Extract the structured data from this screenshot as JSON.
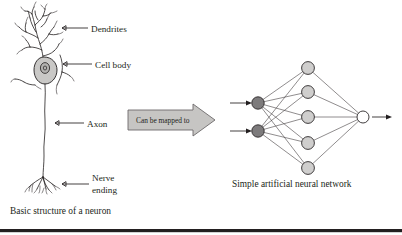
{
  "figure": {
    "title_left": "Basic structure of a neuron",
    "title_right": "Simple artificial neural network",
    "background_color": "#ffffff",
    "ink_color": "#231f20"
  },
  "neuron": {
    "labels": [
      {
        "id": "dendrites",
        "text": "Dendrites"
      },
      {
        "id": "cell-body",
        "text": "Cell body"
      },
      {
        "id": "axon",
        "text": "Axon"
      },
      {
        "id": "nerve-ending-line1",
        "text": "Nerve"
      },
      {
        "id": "nerve-ending-line2",
        "text": "ending"
      }
    ],
    "caption": "Basic structure of a neuron",
    "cell_body_fill": "#c9c8c6",
    "nucleus_fill": "#b3b2b0"
  },
  "mapping_arrow": {
    "text": "Can be mapped to",
    "fill": "#c6c5c3",
    "stroke": "#6d6a6b"
  },
  "network": {
    "caption": "Simple artificial neural network",
    "layers": [
      {
        "id": "input-layer",
        "name": "input",
        "fill": "#7d7b7c",
        "count": 2,
        "nodes": [
          {
            "id": "input-node-1",
            "cx": 258,
            "cy": 103,
            "r": 6.2
          },
          {
            "id": "input-node-2",
            "cx": 258,
            "cy": 131,
            "r": 6.2
          }
        ]
      },
      {
        "id": "hidden-layer",
        "name": "hidden",
        "fill": "#cfcecd",
        "count": 5,
        "nodes": [
          {
            "id": "hidden-node-1",
            "cx": 308,
            "cy": 68,
            "r": 6.4
          },
          {
            "id": "hidden-node-2",
            "cx": 308,
            "cy": 92,
            "r": 6.4
          },
          {
            "id": "hidden-node-3",
            "cx": 308,
            "cy": 117,
            "r": 6.4
          },
          {
            "id": "hidden-node-4",
            "cx": 308,
            "cy": 143,
            "r": 6.4
          },
          {
            "id": "hidden-node-5",
            "cx": 308,
            "cy": 168,
            "r": 6.4
          }
        ]
      },
      {
        "id": "output-layer",
        "name": "output",
        "fill": "#ffffff",
        "count": 1,
        "nodes": [
          {
            "id": "output-node-1",
            "cx": 363,
            "cy": 117,
            "r": 6.0
          }
        ]
      }
    ],
    "input_arrows": 2,
    "output_arrows": 1
  }
}
